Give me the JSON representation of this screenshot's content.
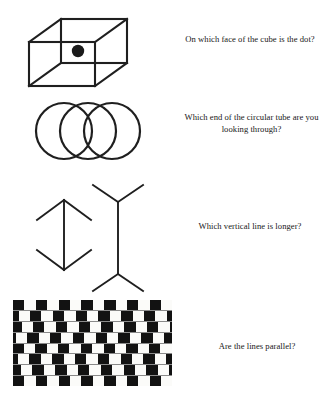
{
  "page": {
    "background_color": "#ffffff",
    "ink_color": "#1f1f1f",
    "width": 326,
    "height": 407
  },
  "puzzles": [
    {
      "id": "cube",
      "figure_name": "necker-cube-figure",
      "figure_type": "wireframe-cube-with-dot",
      "prompt": "On which face of the cube is the dot?",
      "illusion": "Necker cube"
    },
    {
      "id": "tube",
      "figure_name": "circular-tube-figure",
      "figure_type": "three-overlapping-circles",
      "prompt": "Which end of the circular tube are you looking through?",
      "illusion": "ambiguous cylinder"
    },
    {
      "id": "lines",
      "figure_name": "muller-lyer-figure",
      "figure_type": "two-vertical-lines-with-fins",
      "prompt": "Which vertical line is longer?",
      "illusion": "Muller-Lyer"
    },
    {
      "id": "parallel",
      "figure_name": "cafe-wall-figure",
      "figure_type": "offset-checker-rows",
      "prompt": "Are the lines parallel?",
      "illusion": "Cafe wall"
    }
  ],
  "cafe_wall": {
    "rows": 8,
    "cells_per_row": 16,
    "cell_width": 11.4,
    "row_height": 10.75,
    "black_color": "#121212",
    "white_color": "#fbfbf9",
    "mortar_color": "#8a8a8a",
    "row_offsets": [
      0,
      -5.7,
      -2.8,
      -8.5,
      -0.6,
      -6.3,
      -3.4,
      0
    ]
  }
}
